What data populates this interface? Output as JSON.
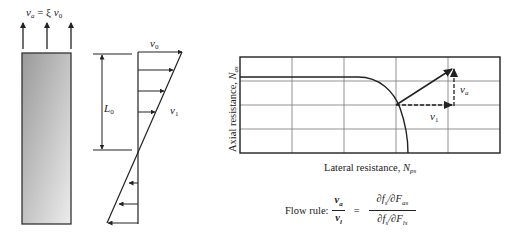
{
  "figure": {
    "pile": {
      "top_label": {
        "v": "v",
        "v_sub": "a",
        "eq": " = ξ ",
        "v0": "v",
        "v0_sub": "0"
      },
      "upward_arrow_count": 3,
      "fill_gradient": [
        "#9a9a9a",
        "#ececec"
      ]
    },
    "velocity_profile": {
      "top_label": {
        "v": "v",
        "sub": "0"
      },
      "right_label": {
        "v": "v",
        "sub": "1"
      },
      "length_label": {
        "L": "L",
        "sub": "0"
      }
    },
    "interaction_chart": {
      "ylabel": "Axial resistance, ",
      "ylabel_symbol": {
        "N": "N",
        "sub": "as"
      },
      "xlabel": "Lateral resistance, ",
      "xlabel_symbol": {
        "N": "N",
        "sub": "ps"
      },
      "vector_labels": {
        "va": {
          "v": "v",
          "sub": "a"
        },
        "v1": {
          "v": "v",
          "sub": "1"
        }
      }
    },
    "flow_rule": {
      "label": "Flow rule:",
      "lhs_num": {
        "v": "v",
        "sub": "a"
      },
      "lhs_den": {
        "v": "v",
        "sub": "l"
      },
      "eq": "=",
      "rhs_num": "∂f",
      "rhs_num_sub1": "s",
      "rhs_num_mid": "/∂F",
      "rhs_num_sub2": "as",
      "rhs_den": "∂f",
      "rhs_den_sub1": "s",
      "rhs_den_mid": "/∂F",
      "rhs_den_sub2": "ls"
    }
  }
}
